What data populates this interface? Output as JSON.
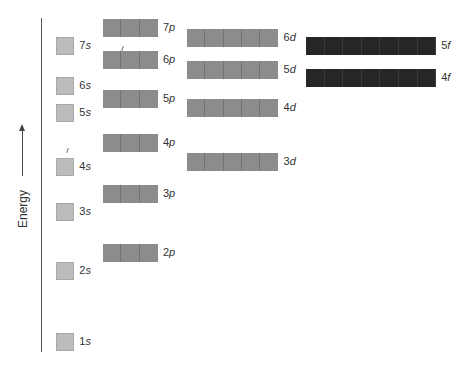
{
  "diagram": {
    "axis_label": "Energy",
    "colors": {
      "s": "#bcbcbc",
      "p": "#8c8c8c",
      "d": "#8c8c8c",
      "f": "#262626"
    },
    "orbitals": [
      {
        "id": "1s",
        "n": "1",
        "l": "s",
        "boxes": 1,
        "x": 56,
        "y": 333
      },
      {
        "id": "2s",
        "n": "2",
        "l": "s",
        "boxes": 1,
        "x": 56,
        "y": 262
      },
      {
        "id": "3s",
        "n": "3",
        "l": "s",
        "boxes": 1,
        "x": 56,
        "y": 203
      },
      {
        "id": "4s",
        "n": "4",
        "l": "s",
        "boxes": 1,
        "x": 56,
        "y": 158
      },
      {
        "id": "5s",
        "n": "5",
        "l": "s",
        "boxes": 1,
        "x": 56,
        "y": 104
      },
      {
        "id": "6s",
        "n": "6",
        "l": "s",
        "boxes": 1,
        "x": 56,
        "y": 77
      },
      {
        "id": "7s",
        "n": "7",
        "l": "s",
        "boxes": 1,
        "x": 56,
        "y": 37
      },
      {
        "id": "2p",
        "n": "2",
        "l": "p",
        "boxes": 3,
        "x": 103,
        "y": 244
      },
      {
        "id": "3p",
        "n": "3",
        "l": "p",
        "boxes": 3,
        "x": 103,
        "y": 185
      },
      {
        "id": "4p",
        "n": "4",
        "l": "p",
        "boxes": 3,
        "x": 103,
        "y": 134
      },
      {
        "id": "5p",
        "n": "5",
        "l": "p",
        "boxes": 3,
        "x": 103,
        "y": 90
      },
      {
        "id": "6p",
        "n": "6",
        "l": "p",
        "boxes": 3,
        "x": 103,
        "y": 51
      },
      {
        "id": "7p",
        "n": "7",
        "l": "p",
        "boxes": 3,
        "x": 103,
        "y": 19
      },
      {
        "id": "3d",
        "n": "3",
        "l": "d",
        "boxes": 5,
        "x": 187,
        "y": 153
      },
      {
        "id": "4d",
        "n": "4",
        "l": "d",
        "boxes": 5,
        "x": 187,
        "y": 99
      },
      {
        "id": "5d",
        "n": "5",
        "l": "d",
        "boxes": 5,
        "x": 187,
        "y": 61
      },
      {
        "id": "6d",
        "n": "6",
        "l": "d",
        "boxes": 5,
        "x": 187,
        "y": 29
      },
      {
        "id": "4f",
        "n": "4",
        "l": "f",
        "boxes": 7,
        "x": 306,
        "y": 69
      },
      {
        "id": "5f",
        "n": "5",
        "l": "f",
        "boxes": 7,
        "x": 306,
        "y": 37
      }
    ]
  }
}
